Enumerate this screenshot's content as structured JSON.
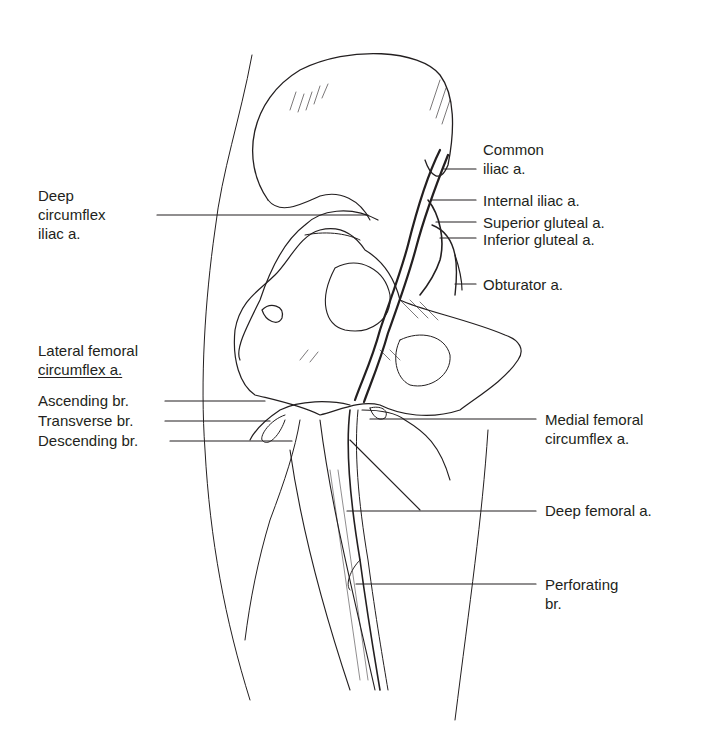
{
  "figure": {
    "labels_left": [
      {
        "id": "deep-circumflex-iliac",
        "lines": [
          "Deep",
          "circumflex",
          "iliac a."
        ]
      },
      {
        "id": "lateral-femoral-circumflex-heading",
        "lines": [
          "Lateral femoral",
          "circumflex a."
        ]
      },
      {
        "id": "ascending-branch",
        "lines": [
          "Ascending br."
        ]
      },
      {
        "id": "transverse-branch",
        "lines": [
          "Transverse br."
        ]
      },
      {
        "id": "descending-branch",
        "lines": [
          "Descending br."
        ]
      }
    ],
    "labels_right": [
      {
        "id": "common-iliac",
        "lines": [
          "Common",
          "iliac a."
        ]
      },
      {
        "id": "internal-iliac",
        "lines": [
          "Internal iliac a."
        ]
      },
      {
        "id": "superior-gluteal",
        "lines": [
          "Superior gluteal a."
        ]
      },
      {
        "id": "inferior-gluteal",
        "lines": [
          "Inferior gluteal a."
        ]
      },
      {
        "id": "obturator",
        "lines": [
          "Obturator a."
        ]
      },
      {
        "id": "medial-femoral-circumflex",
        "lines": [
          "Medial femoral",
          "circumflex a."
        ]
      },
      {
        "id": "deep-femoral",
        "lines": [
          "Deep femoral a."
        ]
      },
      {
        "id": "perforating-branch",
        "lines": [
          "Perforating",
          "br."
        ]
      }
    ],
    "colors": {
      "ink": "#231f20",
      "background": "#ffffff"
    }
  }
}
